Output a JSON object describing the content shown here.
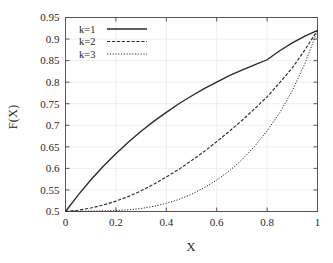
{
  "chart_data": {
    "type": "line",
    "title": "",
    "xlabel": "X",
    "ylabel": "F(X)",
    "xlim": [
      0,
      1
    ],
    "ylim": [
      0.5,
      0.95
    ],
    "grid": true,
    "legend_position": "top-left",
    "x_ticks": [
      "0",
      "0.2",
      "0.4",
      "0.6",
      "0.8",
      "1"
    ],
    "x_tick_values": [
      0,
      0.2,
      0.4,
      0.6,
      0.8,
      1
    ],
    "y_ticks": [
      "0.5",
      "0.55",
      "0.6",
      "0.65",
      "0.7",
      "0.75",
      "0.8",
      "0.85",
      "0.9",
      "0.95"
    ],
    "y_tick_values": [
      0.5,
      0.55,
      0.6,
      0.65,
      0.7,
      0.75,
      0.8,
      0.85,
      0.9,
      0.95
    ],
    "x": [
      0,
      0.05,
      0.1,
      0.15,
      0.2,
      0.25,
      0.3,
      0.35,
      0.4,
      0.45,
      0.5,
      0.55,
      0.6,
      0.65,
      0.7,
      0.75,
      0.8,
      0.85,
      0.9,
      0.95,
      1
    ],
    "series": [
      {
        "name": "k=1",
        "style": "solid",
        "values": [
          0.5,
          0.538,
          0.573,
          0.605,
          0.634,
          0.661,
          0.686,
          0.709,
          0.73,
          0.75,
          0.768,
          0.785,
          0.8,
          0.815,
          0.828,
          0.84,
          0.852,
          0.873,
          0.891,
          0.907,
          0.92
        ]
      },
      {
        "name": "k=2",
        "style": "dashed",
        "values": [
          0.5,
          0.503,
          0.508,
          0.515,
          0.524,
          0.535,
          0.548,
          0.563,
          0.58,
          0.598,
          0.618,
          0.639,
          0.662,
          0.686,
          0.711,
          0.738,
          0.766,
          0.799,
          0.833,
          0.875,
          0.92
        ]
      },
      {
        "name": "k=3",
        "style": "dotted",
        "values": [
          0.5,
          0.5005,
          0.501,
          0.5015,
          0.502,
          0.504,
          0.507,
          0.512,
          0.519,
          0.528,
          0.54,
          0.555,
          0.573,
          0.594,
          0.62,
          0.651,
          0.687,
          0.729,
          0.78,
          0.843,
          0.92
        ]
      }
    ],
    "legend": [
      {
        "label": "k=1",
        "style": "solid"
      },
      {
        "label": "k=2",
        "style": "dashed"
      },
      {
        "label": "k=3",
        "style": "dotted"
      }
    ]
  }
}
